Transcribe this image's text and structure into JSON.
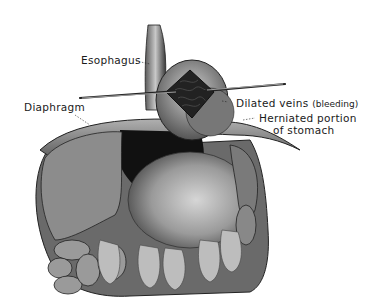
{
  "figure": {
    "labels": {
      "esophagus": "Esophagus",
      "diaphragm": "Diaphragm",
      "dilated_veins": "Dilated veins",
      "dilated_veins_note": "(bleeding)",
      "herniated_line1": "Herniated portion",
      "herniated_line2": "of stomach"
    }
  }
}
